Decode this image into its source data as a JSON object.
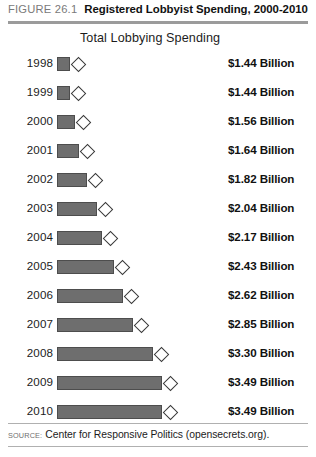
{
  "header": {
    "figure_number": "FIGURE 26.1",
    "title": "Registered Lobbyist Spending, 2000-2010"
  },
  "subtitle": "Total Lobbying Spending",
  "footer": {
    "source_label": "SOURCE:",
    "source_text": "Center for Responsive Politics (opensecrets.org)."
  },
  "colors": {
    "bar_fill": "#6e6e6e",
    "bar_stroke": "#4d4d4d",
    "marker_fill": "#ffffff",
    "marker_stroke": "#3a3a3a",
    "rule": "#9b9b9b",
    "figure_number": "#7a7a7a"
  },
  "chart_data": {
    "type": "bar",
    "orientation": "horizontal",
    "title": "Registered Lobbyist Spending, 2000-2010",
    "subtitle": "Total Lobbying Spending",
    "xlabel": "",
    "ylabel": "",
    "grid": false,
    "legend": "none",
    "axis_zero_suppressed": true,
    "units": "Billion USD",
    "categories": [
      "1998",
      "1999",
      "2000",
      "2001",
      "2002",
      "2003",
      "2004",
      "2005",
      "2006",
      "2007",
      "2008",
      "2009",
      "2010"
    ],
    "values": [
      1.44,
      1.44,
      1.56,
      1.64,
      1.82,
      2.04,
      2.17,
      2.43,
      2.62,
      2.85,
      3.3,
      3.49,
      3.49
    ],
    "data_labels": [
      "$1.44 Billion",
      "$1.44 Billion",
      "$1.56 Billion",
      "$1.64 Billion",
      "$1.82 Billion",
      "$2.04 Billion",
      "$2.17 Billion",
      "$2.43 Billion",
      "$2.62 Billion",
      "$2.85 Billion",
      "$3.30 Billion",
      "$3.49 Billion",
      "$3.49 Billion"
    ],
    "marker": "diamond",
    "xlim": [
      1.16,
      3.6
    ]
  }
}
